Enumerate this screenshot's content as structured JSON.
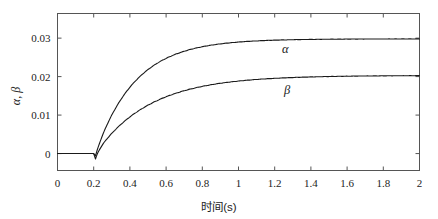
{
  "figure": {
    "name": "alpha-beta-step-response",
    "background": "#ffffff",
    "line_color": "#1a1a1a",
    "axis_color": "#555555"
  },
  "axes": {
    "x": {
      "label": "时间(s)",
      "ticks": [
        "0",
        "0.2",
        "0.4",
        "0.6",
        "0.8",
        "1",
        "1.2",
        "1.4",
        "1.6",
        "1.8",
        "2"
      ],
      "tick_values": [
        0,
        0.2,
        0.4,
        0.6,
        0.8,
        1.0,
        1.2,
        1.4,
        1.6,
        1.8,
        2.0
      ],
      "range": [
        0,
        2
      ]
    },
    "y": {
      "label": "α, β",
      "ticks": [
        "0",
        "0.01",
        "0.02",
        "0.03"
      ],
      "tick_values": [
        0,
        0.01,
        0.02,
        0.03
      ],
      "range": [
        -0.0044,
        0.0364
      ]
    }
  },
  "annotations": {
    "alpha": "α",
    "beta": "β"
  },
  "chart_data": {
    "type": "line",
    "title": "",
    "xlabel": "时间(s)",
    "ylabel": "α, β",
    "xlim": [
      0,
      2
    ],
    "ylim": [
      -0.0044,
      0.0364
    ],
    "grid": false,
    "legend": "inline-annotations",
    "x_ticks": [
      0,
      0.2,
      0.4,
      0.6,
      0.8,
      1.0,
      1.2,
      1.4,
      1.6,
      1.8,
      2.0
    ],
    "y_ticks": [
      0,
      0.01,
      0.02,
      0.03
    ],
    "step_time": 0.21,
    "series": [
      {
        "name": "α",
        "steady_state": 0.0298,
        "time_constant": 0.22,
        "undershoot": -0.0006,
        "x": [
          0,
          0.05,
          0.1,
          0.15,
          0.2,
          0.21,
          0.22,
          0.24,
          0.26,
          0.28,
          0.3,
          0.34,
          0.38,
          0.42,
          0.46,
          0.5,
          0.55,
          0.6,
          0.65,
          0.7,
          0.75,
          0.8,
          0.85,
          0.9,
          0.95,
          1.0,
          1.05,
          1.1,
          1.15,
          1.2,
          1.3,
          1.4,
          1.5,
          1.6,
          1.7,
          1.8,
          1.9,
          2.0
        ],
        "y": [
          0,
          0,
          0,
          0,
          0,
          -0.0006,
          0.0006,
          0.0028,
          0.0048,
          0.0066,
          0.0082,
          0.011,
          0.0134,
          0.0155,
          0.0173,
          0.0188,
          0.0204,
          0.0218,
          0.0229,
          0.0239,
          0.0247,
          0.0254,
          0.026,
          0.0265,
          0.027,
          0.0274,
          0.0277,
          0.028,
          0.0283,
          0.0285,
          0.0289,
          0.0292,
          0.0294,
          0.0295,
          0.0296,
          0.0297,
          0.0297,
          0.0298
        ]
      },
      {
        "name": "β",
        "steady_state": 0.0203,
        "time_constant": 0.3,
        "undershoot": -0.0014,
        "x": [
          0,
          0.05,
          0.1,
          0.15,
          0.2,
          0.21,
          0.22,
          0.24,
          0.26,
          0.28,
          0.3,
          0.34,
          0.38,
          0.42,
          0.46,
          0.5,
          0.55,
          0.6,
          0.65,
          0.7,
          0.75,
          0.8,
          0.85,
          0.9,
          0.95,
          1.0,
          1.05,
          1.1,
          1.15,
          1.2,
          1.3,
          1.4,
          1.5,
          1.6,
          1.7,
          1.8,
          1.9,
          2.0
        ],
        "y": [
          0,
          0,
          0,
          0,
          0,
          -0.0014,
          -0.0004,
          0.0013,
          0.0027,
          0.004,
          0.0052,
          0.0072,
          0.0089,
          0.0104,
          0.0117,
          0.0128,
          0.014,
          0.015,
          0.0159,
          0.0166,
          0.0172,
          0.0177,
          0.0181,
          0.0185,
          0.0188,
          0.019,
          0.0192,
          0.0194,
          0.0195,
          0.0196,
          0.0198,
          0.02,
          0.0201,
          0.0202,
          0.0202,
          0.0203,
          0.0203,
          0.0203
        ]
      }
    ]
  }
}
